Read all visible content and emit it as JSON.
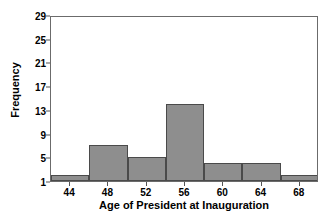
{
  "chart_data": {
    "type": "bar",
    "title": "",
    "xlabel": "Age of President at Inauguration",
    "ylabel": "Frequency",
    "categories": [
      "44",
      "48",
      "52",
      "56",
      "60",
      "64",
      "68"
    ],
    "bin_centers": [
      44,
      48,
      52,
      56,
      60,
      64,
      68
    ],
    "bin_edges": [
      42,
      46,
      50,
      54,
      58,
      62,
      66,
      70
    ],
    "values": [
      2,
      7,
      5,
      14,
      4,
      4,
      2
    ],
    "xtick_labels": [
      "44",
      "48",
      "52",
      "56",
      "60",
      "64",
      "68"
    ],
    "ytick_labels": [
      "1",
      "5",
      "9",
      "13",
      "17",
      "21",
      "25",
      "29"
    ],
    "ytick_values": [
      1,
      5,
      9,
      13,
      17,
      21,
      25,
      29
    ],
    "ylim": [
      1,
      29
    ],
    "xlim": [
      42,
      70
    ],
    "grid": false,
    "legend": false,
    "bar_fill_color": "#8e8e8e",
    "bar_edge_color": "#4a4a4a",
    "axis_color": "#6b6b6b",
    "background_color": "#ffffff"
  }
}
